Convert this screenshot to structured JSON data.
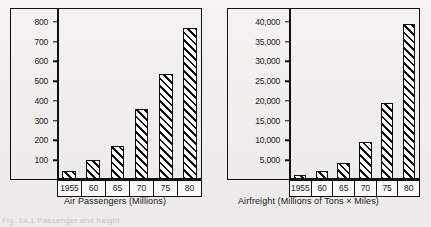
{
  "figure": {
    "background_color": "#f2f1ef",
    "ink_color": "#111111",
    "partial_figure_caption": "Fig. 14.1  Passenger and freight"
  },
  "chart_data": [
    {
      "type": "bar",
      "title": "",
      "caption": "Air Passengers (Millions)",
      "xlabel": "",
      "ylabel": "",
      "categories": [
        "1955",
        "60",
        "65",
        "70",
        "75",
        "80"
      ],
      "values": [
        45,
        100,
        170,
        360,
        535,
        770
      ],
      "ytick_labels": [
        "100",
        "200",
        "300",
        "400",
        "500",
        "600",
        "700",
        "800"
      ],
      "ytick_values": [
        100,
        200,
        300,
        400,
        500,
        600,
        700,
        800
      ],
      "ylim": [
        0,
        870
      ],
      "grid": false,
      "legend": "none",
      "bar_fill": "diagonal-hatch"
    },
    {
      "type": "bar",
      "title": "",
      "caption": "Airfreight (Millions of Tons × Miles)",
      "xlabel": "",
      "ylabel": "",
      "categories": [
        "1955",
        "60",
        "65",
        "70",
        "75",
        "80"
      ],
      "values": [
        1300,
        2200,
        4400,
        9500,
        19500,
        39500
      ],
      "ytick_labels": [
        "5,000",
        "10,000",
        "15,000",
        "20,000",
        "25,000",
        "30,000",
        "35,000",
        "40,000"
      ],
      "ytick_values": [
        5000,
        10000,
        15000,
        20000,
        25000,
        30000,
        35000,
        40000
      ],
      "ylim": [
        0,
        43500
      ],
      "grid": false,
      "legend": "none",
      "bar_fill": "diagonal-hatch"
    }
  ]
}
